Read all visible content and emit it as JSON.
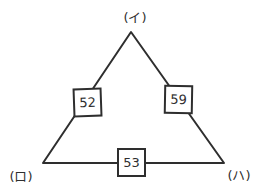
{
  "diagram": {
    "type": "labeled-triangle",
    "vertices": {
      "top": {
        "label": "(イ)"
      },
      "bottom_left": {
        "label": "(ロ)"
      },
      "bottom_right": {
        "label": "(ハ)"
      }
    },
    "edges": {
      "left": {
        "value": "52"
      },
      "right": {
        "value": "59"
      },
      "bottom": {
        "value": "53"
      }
    },
    "colors": {
      "line": "#2e2e2e",
      "box_fill": "#ffffff",
      "background": "#ffffff"
    }
  }
}
